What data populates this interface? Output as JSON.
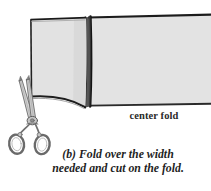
{
  "figure": {
    "name": "fold-over-width-diagram",
    "background_color": "#ffffff",
    "paper": {
      "fill_color": "#e3e3e3",
      "outline_color": "#1a1a1a",
      "shade_color": "#d5d5d5"
    },
    "scissors": {
      "stroke_color": "#6e6e6e",
      "fill_color": "#cfcfcf",
      "highlight_color": "#ffffff"
    }
  },
  "labels": {
    "center_fold": "center fold"
  },
  "caption": {
    "line1": "(b) Fold over the width",
    "line2": "needed and cut on the fold."
  }
}
